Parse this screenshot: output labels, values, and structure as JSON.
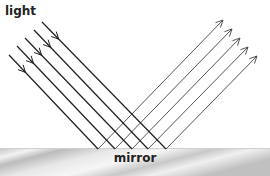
{
  "labels": {
    "light": "light",
    "mirror": "mirror"
  },
  "colors": {
    "incident_ray": "#1e1e1e",
    "reflected_ray": "#555555",
    "mirror_light": "#f4f4f4",
    "mirror_dark": "#b8b8b8"
  },
  "diagram": {
    "type": "reflection",
    "mirror_y": 149,
    "rays": [
      {
        "start": [
          9,
          55
        ],
        "hit": [
          98,
          149
        ],
        "end": [
          223,
          20
        ]
      },
      {
        "start": [
          17,
          46
        ],
        "hit": [
          115,
          149
        ],
        "end": [
          232,
          29
        ]
      },
      {
        "start": [
          25,
          38
        ],
        "hit": [
          132,
          149
        ],
        "end": [
          240,
          38
        ]
      },
      {
        "start": [
          34,
          30
        ],
        "hit": [
          148,
          149
        ],
        "end": [
          248,
          47
        ]
      },
      {
        "start": [
          42,
          22
        ],
        "hit": [
          166,
          149
        ],
        "end": [
          257,
          56
        ]
      }
    ]
  }
}
